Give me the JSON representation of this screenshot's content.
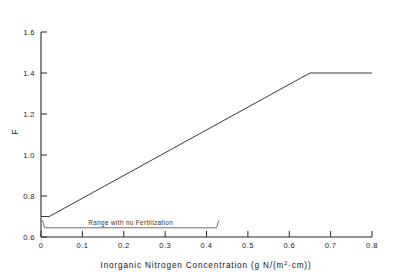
{
  "figure": {
    "background": "#ffffff",
    "line_color": "#3a3a3a",
    "axis_color": "#2b2b2b"
  },
  "labels": {
    "xlabel_part1": "Inorganic Nitrogen Concentration  (g N/(m",
    "xlabel_sup": "2",
    "xlabel_part2": "·cm))",
    "ylabel": "F",
    "annotation": "Range with no Fertilization"
  },
  "chart_data": {
    "type": "line",
    "title": "",
    "xlabel": "Inorganic Nitrogen Concentration (g N/(m2·cm))",
    "ylabel": "F",
    "xlim": [
      0.0,
      0.8
    ],
    "ylim": [
      0.6,
      1.6
    ],
    "xticks": [
      0.0,
      0.1,
      0.2,
      0.3,
      0.4,
      0.5,
      0.6,
      0.7,
      0.8
    ],
    "xticklabels": [
      "0",
      "0.1",
      "0.2",
      "0.3",
      "0.4",
      "0.5",
      "0.6",
      "0.7",
      "0.8"
    ],
    "yticks": [
      0.6,
      0.8,
      1.0,
      1.2,
      1.4,
      1.6
    ],
    "yticklabels": [
      "0.6",
      "0.8",
      "1.0",
      "1.2",
      "1.4",
      "1.6"
    ],
    "grid": false,
    "legend": "none",
    "series": [
      {
        "name": "F",
        "x": [
          0.0,
          0.02,
          0.65,
          0.8
        ],
        "y": [
          0.7,
          0.7,
          1.4,
          1.4
        ]
      }
    ],
    "annotations": [
      {
        "text": "Range with no Fertilization",
        "type": "bracket",
        "x_start": 0.0,
        "x_end": 0.43,
        "y": 0.645
      }
    ]
  }
}
